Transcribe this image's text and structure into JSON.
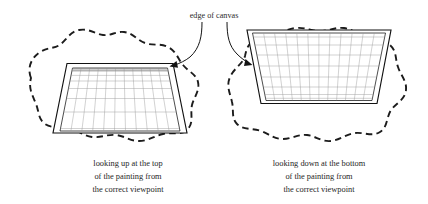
{
  "diagram": {
    "title_label": "edge of canvas",
    "background_color": "#ffffff",
    "ink_color": "#111111",
    "grid_color": "#9a9a9a",
    "panels": [
      {
        "id": "left",
        "caption_lines": [
          "looking up at the top",
          "of the painting from",
          "the correct viewpoint"
        ],
        "orientation": "narrow-top-wide-bottom",
        "grid_columns": 11,
        "grid_rows": 7
      },
      {
        "id": "right",
        "caption_lines": [
          "looking down at the bottom",
          "of the painting from",
          "the correct viewpoint"
        ],
        "orientation": "wide-top-narrow-bottom",
        "grid_columns": 12,
        "grid_rows": 7
      }
    ],
    "annotations": {
      "arrow_left_target": "left-painting-top-right-corner",
      "arrow_right_target": "right-painting-top-left-corner"
    }
  }
}
